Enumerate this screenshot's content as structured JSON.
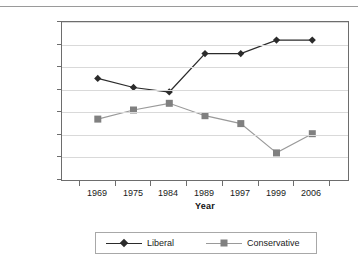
{
  "chart_data": {
    "type": "line",
    "title": "",
    "xlabel": "Year",
    "ylabel": "Percentage",
    "categories": [
      "1969",
      "1975",
      "1984",
      "1989",
      "1997",
      "1999",
      "2006"
    ],
    "series": [
      {
        "name": "Liberal",
        "color": "#2b2b2b",
        "marker": "diamond",
        "values": [
          45,
          41,
          39,
          56,
          56,
          62,
          62
        ]
      },
      {
        "name": "Conservative",
        "color": "#808080",
        "marker": "square",
        "values": [
          27,
          31,
          34,
          28.5,
          25,
          12,
          20.5
        ]
      }
    ],
    "ylim": [
      0,
      70
    ],
    "yticks": [
      0,
      10,
      20,
      30,
      40,
      50,
      60,
      70
    ],
    "ytick_labels": [
      "0",
      "10",
      "20",
      "30",
      "40",
      "50",
      "60",
      "70"
    ],
    "grid": true,
    "grid_axis": "y",
    "legend_position": "bottom",
    "legend_entries": [
      "Liberal",
      "Conservative"
    ]
  },
  "axes": {
    "y_title": "Percentage",
    "x_title": "Year"
  },
  "legend": {
    "items": [
      {
        "label": "Liberal"
      },
      {
        "label": "Conservative"
      }
    ]
  }
}
